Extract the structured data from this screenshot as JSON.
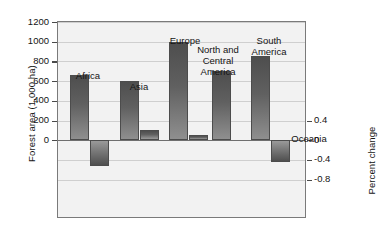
{
  "chart_data": {
    "type": "bar",
    "title": "",
    "subtitle": "",
    "categories": [
      "Africa",
      "Asia",
      "Europe",
      "North and\nCentral\nAmerica",
      "South\nAmerica",
      "Oceania"
    ],
    "series": [
      {
        "name": "Forest area (1,000 ha)",
        "axis": "left",
        "unit": "1,000 ha",
        "values": [
          660,
          600,
          1000,
          700,
          850,
          0
        ]
      },
      {
        "name": "Percent change",
        "axis": "right",
        "unit": "percent",
        "values": [
          -0.52,
          0.2,
          0.1,
          0.0,
          -0.45,
          0.4
        ]
      }
    ],
    "ylabel": "Forest area (1,000 ha)",
    "ylabel_right": "Percent change",
    "xlabel": "",
    "ylim": [
      -800,
      1200
    ],
    "ylim_right": [
      -0.8,
      1.2
    ],
    "yticks": [
      0,
      200,
      400,
      600,
      800,
      1000,
      1200
    ],
    "ytick_labels": [
      "0",
      "200",
      "400",
      "600",
      "800",
      "1000",
      "1200"
    ],
    "yticks_right": [
      -0.8,
      -0.4,
      0,
      0.4
    ],
    "ytick_labels_right": [
      "-0.8",
      "-0.4",
      "0",
      "0.4"
    ],
    "grid": true,
    "legend": "none",
    "oceania_note": "Oceania forest area bar not drawn; only percent change shown"
  },
  "axes": {
    "left_title": "Forest area (1,000 ha)",
    "right_title": "Percent change"
  },
  "ticks_left": [
    {
      "label": "1200",
      "value": 1200
    },
    {
      "label": "1000",
      "value": 1000
    },
    {
      "label": "800",
      "value": 800
    },
    {
      "label": "600",
      "value": 600
    },
    {
      "label": "400",
      "value": 400
    },
    {
      "label": "200",
      "value": 200
    },
    {
      "label": "0",
      "value": 0
    }
  ],
  "ticks_right": [
    {
      "label": "0.4",
      "value": 0.4
    },
    {
      "label": "0",
      "value": 0
    },
    {
      "label": "-0.4",
      "value": -0.4
    },
    {
      "label": "-0.8",
      "value": -0.8
    }
  ],
  "groups": [
    {
      "label": "Africa",
      "area": 660,
      "pct": -0.52
    },
    {
      "label": "Asia",
      "area": 600,
      "pct": 0.2
    },
    {
      "label": "Europe",
      "area": 1000,
      "pct": 0.1
    },
    {
      "label": "North and\nCentral\nAmerica",
      "area": 700,
      "pct": 0.0
    },
    {
      "label": "South\nAmerica",
      "area": 850,
      "pct": -0.45
    },
    {
      "label": "Oceania",
      "area": null,
      "pct": 0.4
    }
  ],
  "colors": {
    "bar_dark": "#4e4e4e",
    "bar_light": "#9a9a9a",
    "plot_background": "#f2f2f2",
    "frame": "#7a7a7a",
    "grid": "#cfcfcf",
    "text": "#141414"
  }
}
